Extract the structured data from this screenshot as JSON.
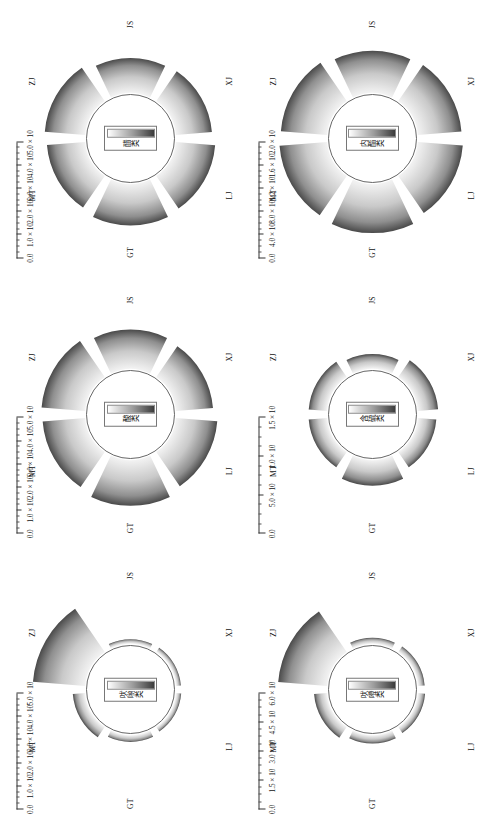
{
  "figure": {
    "type": "multi-panel radial bar chart (rose diagram) grid",
    "rows": 2,
    "cols": 3,
    "orientation": "figure rendered rotated 90 degrees",
    "sector_order": [
      "ZJ",
      "JS",
      "XJ",
      "LJ",
      "GT",
      "MT"
    ],
    "colorbar_low_color": "#ffffff",
    "colorbar_high_color": "#3c3c3c",
    "hub_fill": "#ffffff",
    "hub_stroke": "#555555"
  },
  "chart_data": [
    {
      "type": "bar",
      "title": "吠喲类",
      "panel_index": 0,
      "categories": [
        "ZJ",
        "JS",
        "XJ",
        "LJ",
        "GT",
        "MT"
      ],
      "values": [
        48000,
        4000,
        4200,
        4500,
        6000,
        11000
      ],
      "ylabel": "",
      "xlabel": "",
      "ylim": [
        0,
        50000
      ],
      "tick_labels": [
        "0.0",
        "1.0 × 10⁴",
        "2.0 × 10⁴",
        "3.0 × 10⁴",
        "4.0 × 10⁴",
        "5.0 × 10⁴"
      ],
      "tick_mantissas": [
        "0.0",
        "1.0 × 10",
        "2.0 × 10",
        "3.0 × 10",
        "4.0 × 10",
        "5.0 × 10"
      ],
      "tick_exponents": [
        "",
        "4",
        "4",
        "4",
        "4",
        "4"
      ],
      "tick_values": [
        0,
        10000,
        20000,
        30000,
        40000,
        50000
      ]
    },
    {
      "type": "bar",
      "title": "酸类",
      "panel_index": 1,
      "categories": [
        "ZJ",
        "JS",
        "XJ",
        "LJ",
        "GT",
        "MT"
      ],
      "values": [
        40000,
        36000,
        34000,
        38000,
        42000,
        39000
      ],
      "ylabel": "",
      "xlabel": "",
      "ylim": [
        0,
        50000
      ],
      "tick_labels": [
        "0.0",
        "1.0 × 10⁵",
        "2.0 × 10⁵",
        "3.0 × 10⁵",
        "4.0 × 10⁵",
        "5.0 × 10⁵"
      ],
      "tick_mantissas": [
        "0.0",
        "1.0 × 10",
        "2.0 × 10",
        "3.0 × 10",
        "4.0 × 10",
        "5.0 × 10"
      ],
      "tick_exponents": [
        "",
        "5",
        "5",
        "5",
        "5",
        "5"
      ],
      "tick_values": [
        0,
        100000,
        200000,
        300000,
        400000,
        500000
      ]
    },
    {
      "type": "bar",
      "title": "醋类",
      "panel_index": 2,
      "categories": [
        "ZJ",
        "JS",
        "XJ",
        "LJ",
        "GT",
        "MT"
      ],
      "values": [
        37000,
        32000,
        33000,
        36000,
        38000,
        35000
      ],
      "ylabel": "",
      "xlabel": "",
      "ylim": [
        0,
        50000
      ],
      "tick_labels": [
        "0.0",
        "1.0 × 10⁵",
        "2.0 × 10⁵",
        "3.0 × 10⁵",
        "4.0 × 10⁵",
        "5.0 × 10⁵"
      ],
      "tick_mantissas": [
        "0.0",
        "1.0 × 10",
        "2.0 × 10",
        "3.0 × 10",
        "4.0 × 10",
        "5.0 × 10"
      ],
      "tick_exponents": [
        "",
        "5",
        "5",
        "5",
        "5",
        "5"
      ],
      "tick_values": [
        0,
        100000,
        200000,
        300000,
        400000,
        500000
      ]
    },
    {
      "type": "bar",
      "title": "吠噔类",
      "panel_index": 3,
      "categories": [
        "ZJ",
        "JS",
        "XJ",
        "LJ",
        "GT",
        "MT"
      ],
      "values": [
        54000,
        6500,
        7000,
        7500,
        9000,
        14000
      ],
      "ylabel": "",
      "xlabel": "",
      "ylim": [
        0,
        60000
      ],
      "tick_labels": [
        "0.0",
        "1.5 × 10⁵",
        "3.0 × 10⁵",
        "4.5 × 10⁵",
        "6.0 × 10⁵"
      ],
      "tick_mantissas": [
        "0.0",
        "1.5 × 10",
        "3.0 × 10",
        "4.5 × 10",
        "6.0 × 10"
      ],
      "tick_exponents": [
        "",
        "5",
        "5",
        "5",
        "5"
      ],
      "tick_values": [
        0,
        150000,
        300000,
        450000,
        600000
      ]
    },
    {
      "type": "bar",
      "title": "含硫类",
      "panel_index": 4,
      "categories": [
        "ZJ",
        "JS",
        "XJ",
        "LJ",
        "GT",
        "MT"
      ],
      "values": [
        5000,
        4000,
        5500,
        5000,
        7000,
        5000
      ],
      "ylabel": "",
      "xlabel": "",
      "ylim": [
        0,
        15000
      ],
      "tick_labels": [
        "0.0",
        "5.0 × 10⁵",
        "1.0 × 10⁶",
        "1.5 × 10⁶"
      ],
      "tick_mantissas": [
        "0.0",
        "5.0 × 10",
        "1.0 × 10",
        "1.5 × 10"
      ],
      "tick_exponents": [
        "",
        "5",
        "6",
        "6"
      ],
      "tick_values": [
        0,
        5000,
        10000,
        15000
      ]
    },
    {
      "type": "bar",
      "title": "内酯类",
      "panel_index": 5,
      "categories": [
        "ZJ",
        "JS",
        "XJ",
        "LJ",
        "GT",
        "MT"
      ],
      "values": [
        17000,
        15500,
        16000,
        16500,
        18000,
        17500
      ],
      "ylabel": "",
      "xlabel": "",
      "ylim": [
        0,
        20000
      ],
      "tick_labels": [
        "0.0",
        "4.0 × 10⁵",
        "8.0 × 10⁵",
        "1.2 × 10⁶",
        "1.6 × 10⁶",
        "2.0 × 10⁶"
      ],
      "tick_mantissas": [
        "0.0",
        "4.0 × 10",
        "8.0 × 10",
        "1.2 × 10",
        "1.6 × 10",
        "2.0 × 10"
      ],
      "tick_exponents": [
        "",
        "5",
        "5",
        "6",
        "6",
        "6"
      ],
      "tick_values": [
        0,
        4000,
        8000,
        12000,
        16000,
        20000
      ]
    }
  ]
}
